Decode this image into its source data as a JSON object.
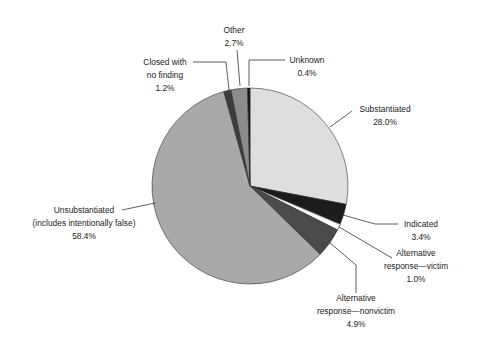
{
  "chart_data": {
    "type": "pie",
    "title": "",
    "start_angle_deg": 0,
    "direction": "clockwise",
    "center": [
      250,
      186
    ],
    "radius": 98,
    "slices": [
      {
        "label": "Substantiated",
        "value": 28.0,
        "pct": "28.0%",
        "color": "#dedede",
        "label_lines": [
          "Substantiated",
          "28.0%"
        ],
        "label_x": 385,
        "label_y": [
          112,
          125
        ],
        "anchor": "middle",
        "leader": [
          [
            330,
            127
          ],
          [
            352,
            111
          ]
        ]
      },
      {
        "label": "Indicated",
        "value": 3.4,
        "pct": "3.4%",
        "color": "#1c1c1c",
        "label_lines": [
          "Indicated",
          "3.4%"
        ],
        "label_x": 421,
        "label_y": [
          227,
          240
        ],
        "anchor": "middle",
        "leader": [
          [
            343,
            215
          ],
          [
            375,
            224
          ],
          [
            398,
            224
          ]
        ]
      },
      {
        "label": "Alternative response—victim",
        "value": 1.0,
        "pct": "1.0%",
        "color": "#ffffff",
        "label_lines": [
          "Alternative",
          "response—victim",
          "1.0%"
        ],
        "label_x": 416,
        "label_y": [
          256,
          269,
          282
        ],
        "anchor": "middle",
        "leader": [
          [
            339,
            227
          ],
          [
            392,
            258
          ]
        ]
      },
      {
        "label": "Alternative response—nonvictim",
        "value": 4.9,
        "pct": "4.9%",
        "color": "#4a4a4a",
        "label_lines": [
          "Alternative",
          "response—nonvictim",
          "4.9%"
        ],
        "label_x": 356,
        "label_y": [
          301,
          314,
          327
        ],
        "anchor": "middle",
        "leader": [
          [
            330,
            243
          ],
          [
            356,
            265
          ],
          [
            356,
            293
          ]
        ]
      },
      {
        "label": "Unsubstantiated (includes intentionally false)",
        "value": 58.4,
        "pct": "58.4%",
        "color": "#a9a9a9",
        "label_lines": [
          "Unsubstantiated",
          "(includes intentionally false)",
          "58.4%"
        ],
        "label_x": 84,
        "label_y": [
          213,
          226,
          239
        ],
        "anchor": "middle",
        "leader": [
          [
            122,
            210
          ],
          [
            155,
            203
          ]
        ]
      },
      {
        "label": "Closed with no finding",
        "value": 1.2,
        "pct": "1.2%",
        "color": "#3c3c3c",
        "label_lines": [
          "Closed with",
          "no finding",
          "1.2%"
        ],
        "label_x": 165,
        "label_y": [
          65,
          78,
          91
        ],
        "anchor": "middle",
        "leader": [
          [
            193,
            62
          ],
          [
            226,
            62
          ],
          [
            229,
            90
          ]
        ]
      },
      {
        "label": "Other",
        "value": 2.7,
        "pct": "2.7%",
        "color": "#8c8c8c",
        "label_lines": [
          "Other",
          "2.7%"
        ],
        "label_x": 234,
        "label_y": [
          33,
          46
        ],
        "anchor": "middle",
        "leader": [
          [
            237,
            50
          ],
          [
            240,
            86
          ]
        ]
      },
      {
        "label": "Unknown",
        "value": 0.4,
        "pct": "0.4%",
        "color": "#111111",
        "label_lines": [
          "Unknown",
          "0.4%"
        ],
        "label_x": 307,
        "label_y": [
          63,
          76
        ],
        "anchor": "middle",
        "leader": [
          [
            249,
            86
          ],
          [
            249,
            60
          ],
          [
            285,
            60
          ]
        ]
      }
    ],
    "legend": null,
    "grid": false
  }
}
